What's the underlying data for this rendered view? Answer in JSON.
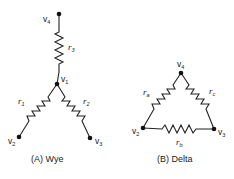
{
  "figure": {
    "wye": {
      "caption": "(A) Wye",
      "nodes": [
        {
          "id": "v4",
          "label": "v",
          "sub": "4"
        },
        {
          "id": "v1",
          "label": "v",
          "sub": "1"
        },
        {
          "id": "v2",
          "label": "v",
          "sub": "2"
        },
        {
          "id": "v3",
          "label": "v",
          "sub": "3"
        }
      ],
      "resistors": [
        {
          "label": "r",
          "sub": "3",
          "from": "v4",
          "to": "v1"
        },
        {
          "label": "r",
          "sub": "1",
          "from": "v1",
          "to": "v2"
        },
        {
          "label": "r",
          "sub": "2",
          "from": "v1",
          "to": "v3"
        }
      ]
    },
    "delta": {
      "caption": "(B) Delta",
      "nodes": [
        {
          "id": "v4",
          "label": "v",
          "sub": "4"
        },
        {
          "id": "v2",
          "label": "v",
          "sub": "2"
        },
        {
          "id": "v3",
          "label": "v",
          "sub": "3"
        }
      ],
      "resistors": [
        {
          "label": "r",
          "sub": "a",
          "from": "v4",
          "to": "v2"
        },
        {
          "label": "r",
          "sub": "c",
          "from": "v4",
          "to": "v3"
        },
        {
          "label": "r",
          "sub": "b",
          "from": "v2",
          "to": "v3"
        }
      ]
    }
  }
}
